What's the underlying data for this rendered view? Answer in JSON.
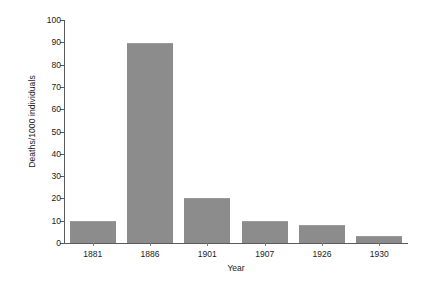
{
  "chart_data": {
    "type": "bar",
    "title": "",
    "subtitle": "",
    "xlabel": "Year",
    "ylabel": "Deaths/1000 individuals",
    "categories": [
      "1881",
      "1886",
      "1901",
      "1907",
      "1926",
      "1930"
    ],
    "values": [
      10,
      89.5,
      20,
      10,
      8,
      3
    ],
    "series": [
      {
        "name": "Deaths per 1000 individuals",
        "values": [
          10,
          89.5,
          20,
          10,
          8,
          3
        ]
      }
    ],
    "ylim": [
      0,
      100
    ],
    "y_ticks": [
      0,
      10,
      20,
      30,
      40,
      50,
      60,
      70,
      80,
      90,
      100
    ],
    "y_tick_labels": [
      "0",
      "10",
      "20",
      "30",
      "40",
      "50",
      "60",
      "70",
      "80",
      "90",
      "100"
    ],
    "grid": false,
    "legend": false,
    "legend_position": "none",
    "bar_color": "#8c8c8c",
    "axis_color": "#5a5a5a",
    "background_color": "#ffffff",
    "annotations": []
  }
}
